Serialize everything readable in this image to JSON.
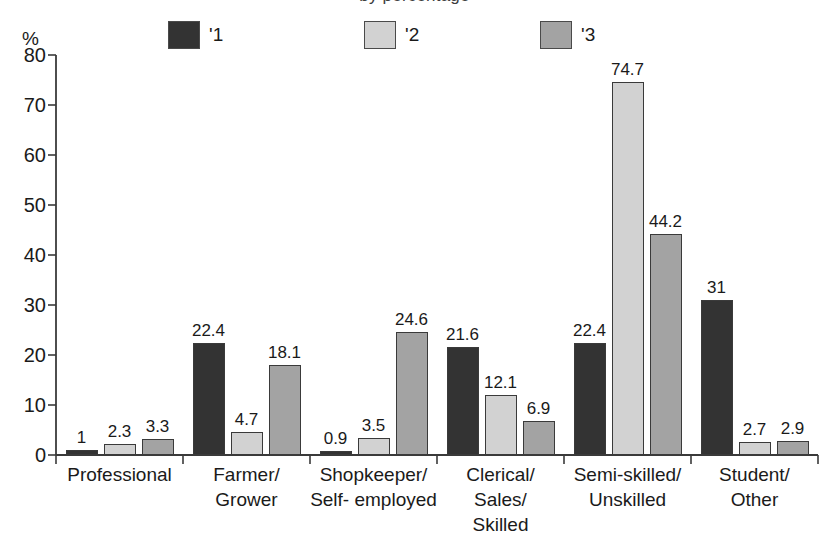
{
  "chart_data": {
    "type": "bar",
    "title": "by percentage",
    "ylabel": "%",
    "xlabel": "",
    "ylim": [
      0,
      80
    ],
    "ytick_step": 10,
    "yticks": [
      0,
      10,
      20,
      30,
      40,
      50,
      60,
      70,
      80
    ],
    "grid": false,
    "legend_position": "top",
    "categories": [
      "Professional",
      "Farmer/\nGrower",
      "Shopkeeper/\nSelf- employed",
      "Clerical/\nSales/\nSkilled",
      "Semi-skilled/\nUnskilled",
      "Student/\nOther"
    ],
    "series": [
      {
        "name": "'1",
        "color": "#333333",
        "values": [
          1,
          22.4,
          0.9,
          21.6,
          22.4,
          31
        ],
        "labels": [
          "1",
          "22.4",
          "0.9",
          "21.6",
          "22.4",
          "31"
        ]
      },
      {
        "name": "'2",
        "color": "#d2d2d2",
        "values": [
          2.3,
          4.7,
          3.5,
          12.1,
          74.7,
          2.7
        ],
        "labels": [
          "2.3",
          "4.7",
          "3.5",
          "12.1",
          "74.7",
          "2.7"
        ]
      },
      {
        "name": "'3",
        "color": "#a3a3a3",
        "values": [
          3.3,
          18.1,
          24.6,
          6.9,
          44.2,
          2.9
        ],
        "labels": [
          "3.3",
          "18.1",
          "24.6",
          "6.9",
          "44.2",
          "2.9"
        ]
      }
    ]
  },
  "legend": {
    "items": [
      {
        "label": "'1",
        "color": "#333333"
      },
      {
        "label": "'2",
        "color": "#d2d2d2"
      },
      {
        "label": "'3",
        "color": "#a3a3a3"
      }
    ]
  }
}
